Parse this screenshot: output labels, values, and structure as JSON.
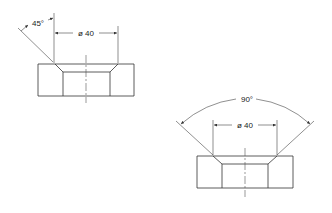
{
  "drawing": {
    "view_left": {
      "label": "countersink-45-view",
      "angle_label": "45°",
      "diameter_label": "ø 40"
    },
    "view_right": {
      "label": "countersink-90-view",
      "angle_label": "90°",
      "diameter_label": "ø 40"
    },
    "colors": {
      "line": "#333333",
      "background": "#ffffff"
    }
  }
}
